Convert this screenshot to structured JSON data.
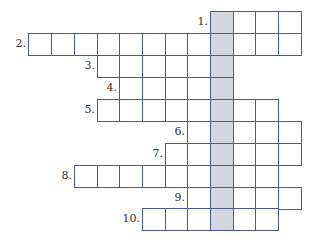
{
  "puzzle": {
    "type": "crossword",
    "colors": {
      "line": "#4a5a98",
      "key_column": "#d3d7de",
      "background": "#ffffff"
    },
    "key_column": 8,
    "col_left": [
      28,
      51,
      74,
      97,
      119,
      142,
      165,
      187,
      210,
      233,
      255,
      278
    ],
    "cell_w": 23,
    "row_top": [
      11,
      33,
      55,
      77,
      99,
      121,
      143,
      165,
      187,
      208
    ],
    "cell_h": 22,
    "rows": [
      {
        "label": "1.",
        "start": 8,
        "end": 11
      },
      {
        "label": "2.",
        "start": 0,
        "end": 11
      },
      {
        "label": "3.",
        "start": 3,
        "end": 8
      },
      {
        "label": "4.",
        "start": 4,
        "end": 8
      },
      {
        "label": "5.",
        "start": 3,
        "end": 10
      },
      {
        "label": "6.",
        "start": 7,
        "end": 11
      },
      {
        "label": "7.",
        "start": 6,
        "end": 11
      },
      {
        "label": "8.",
        "start": 2,
        "end": 10
      },
      {
        "label": "9.",
        "start": 7,
        "end": 11
      },
      {
        "label": "10.",
        "start": 5,
        "end": 10
      }
    ]
  }
}
